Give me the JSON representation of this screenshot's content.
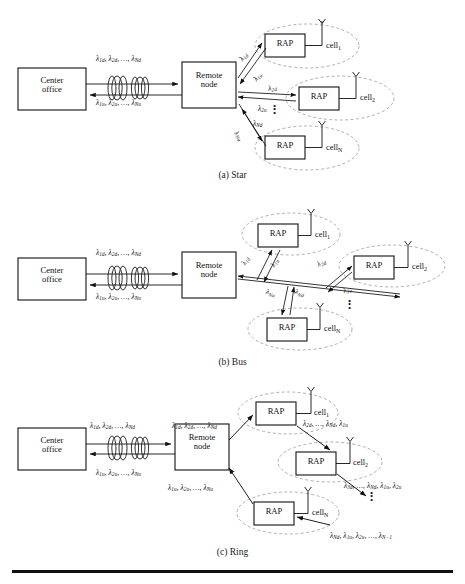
{
  "figure": {
    "divider": true,
    "node_labels": {
      "center_office_l1": "Center",
      "center_office_l2": "office",
      "remote_node_l1": "Remote",
      "remote_node_l2": "node",
      "rap": "RAP",
      "cell1": "cell",
      "cell1_sub": "1",
      "cell2": "cell",
      "cell2_sub": "2",
      "cellN": "cell",
      "cellN_sub": "N",
      "fiber_icon": "fiber-spool",
      "antenna_icon": "antenna"
    },
    "panels": [
      {
        "id": "star",
        "caption": "(a) Star",
        "feeder_down": "λ1d, λ2d, …, λNd",
        "feeder_up": "λ1u, λ2u, …, λNu",
        "labels": [
          {
            "name": "lambda-1d",
            "text": "λ1d"
          },
          {
            "name": "lambda-1u",
            "text": "λ1u"
          },
          {
            "name": "lambda-2d",
            "text": "λ2d"
          },
          {
            "name": "lambda-2u",
            "text": "λ2u"
          },
          {
            "name": "lambda-Nd",
            "text": "λNd"
          },
          {
            "name": "lambda-Nu",
            "text": "λNu"
          }
        ],
        "cells": [
          "cell1",
          "cell2",
          "cellN"
        ]
      },
      {
        "id": "bus",
        "caption": "(b) Bus",
        "feeder_down": "λ1d, λ2d, …, λNd",
        "feeder_up": "λ1u, λ2u, …, λNu",
        "labels": [
          {
            "name": "lambda-1d",
            "text": "λ1d"
          },
          {
            "name": "lambda-1u",
            "text": "λ1u"
          },
          {
            "name": "lambda-2d",
            "text": "λ2d"
          },
          {
            "name": "lambda-2u",
            "text": "λ2u"
          },
          {
            "name": "lambda-Nd",
            "text": "λNd"
          },
          {
            "name": "lambda-Nu",
            "text": "λNu"
          }
        ],
        "cells": [
          "cell1",
          "cell2",
          "cellN"
        ]
      },
      {
        "id": "ring",
        "caption": "(c) Ring",
        "feeder_down": "λ1d, λ2d, …, λNd",
        "feeder_up": "λ1u, λ2u, …, λNu",
        "drop_down": "λ1d, λ2d, …, λNd",
        "drop_up": "λ1u, λ2u, …, λNu",
        "labels": [
          {
            "name": "ring-seg-1",
            "text": "λ2d, …, λNd, λ1u"
          },
          {
            "name": "ring-seg-2",
            "text": "λ3d, …, λNd, λ1u, λ2u"
          },
          {
            "name": "ring-seg-3",
            "text": "λNd, λ1u, λ2u, …, λN−1"
          }
        ],
        "cells": [
          "cell1",
          "cell2",
          "cellN"
        ]
      }
    ]
  },
  "sub_text": {
    "1d": "1d",
    "2d": "2d",
    "Nd": "Nd",
    "1u": "1u",
    "2u": "2u",
    "Nu": "Nu",
    "3d": "3d",
    "N1": "N−1"
  }
}
